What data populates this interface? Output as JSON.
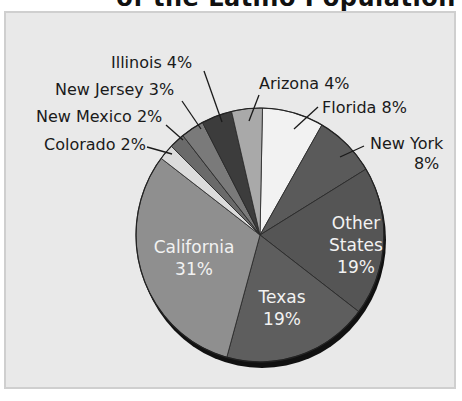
{
  "title": "of the Latino Population",
  "chart_data": {
    "type": "pie",
    "title": "of the Latino Population",
    "categories": [
      "Florida",
      "New York",
      "Other States",
      "Texas",
      "California",
      "Colorado",
      "New Mexico",
      "New Jersey",
      "Illinois",
      "Arizona"
    ],
    "values": [
      8,
      8,
      19,
      19,
      31,
      2,
      2,
      3,
      4,
      4
    ],
    "labels": {
      "florida": "Florida 8%",
      "new_york_1": "New York",
      "new_york_2": "8%",
      "other_1": "Other",
      "other_2": "States",
      "other_3": "19%",
      "texas_1": "Texas",
      "texas_2": "19%",
      "california_1": "California",
      "california_2": "31%",
      "colorado": "Colorado 2%",
      "new_mexico": "New Mexico 2%",
      "new_jersey": "New Jersey 3%",
      "illinois": "Illinois 4%",
      "arizona": "Arizona 4%"
    },
    "colors": [
      "#f2f2f2",
      "#5a5a5a",
      "#555555",
      "#5e5e5e",
      "#8f8f8f",
      "#dcdcdc",
      "#6a6a6a",
      "#7a7a7a",
      "#3c3c3c",
      "#a9a9a9"
    ],
    "legend": "none",
    "grid": false
  }
}
